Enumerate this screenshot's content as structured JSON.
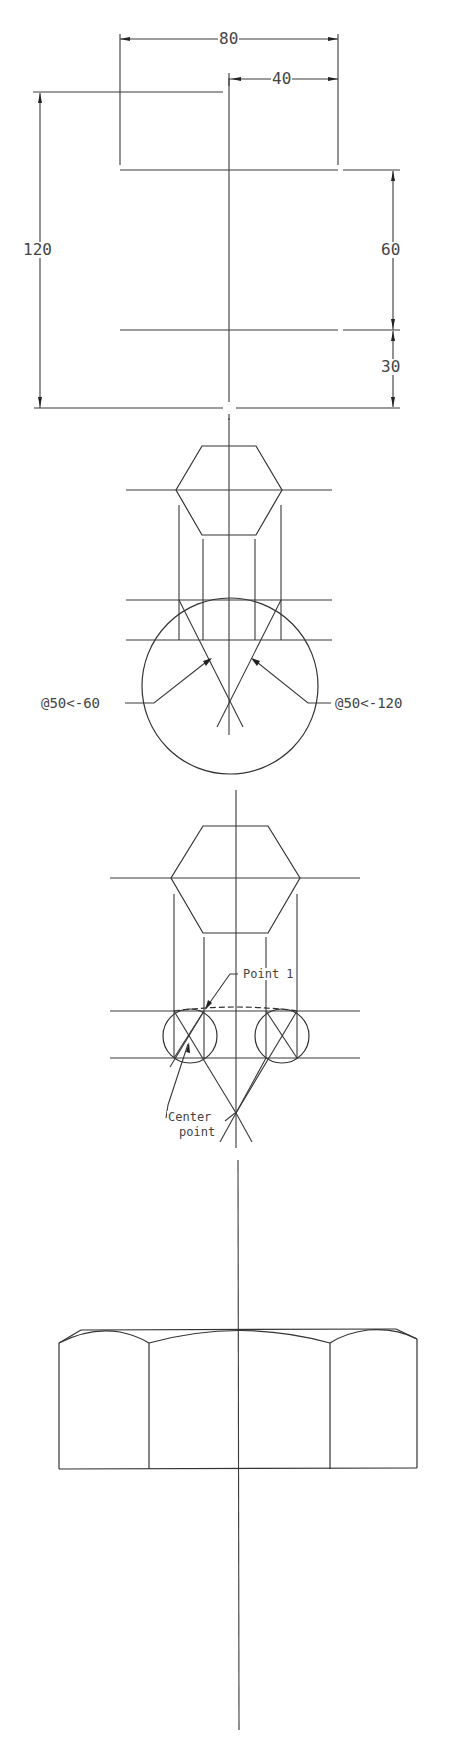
{
  "drawing": {
    "title": "Hex nut construction drawing",
    "line_color": "#333333",
    "background": "#ffffff"
  },
  "dimensions": {
    "overall_width": "80",
    "half_width": "40",
    "overall_height": "120",
    "upper_height": "60",
    "lower_height": "30"
  },
  "annotations": {
    "polar_left": "@50<-60",
    "polar_right": "@50<-120",
    "point_1": "Point 1",
    "center_point_line1": "Center",
    "center_point_line2": "point"
  },
  "views": [
    {
      "name": "Dimension layout",
      "type": "dimension-frame"
    },
    {
      "name": "Hexagon top view with chamfer arc construction",
      "type": "construction"
    },
    {
      "name": "Hexagon top view with side arc construction",
      "type": "construction"
    },
    {
      "name": "Finished hex nut front view",
      "type": "elevation"
    }
  ]
}
